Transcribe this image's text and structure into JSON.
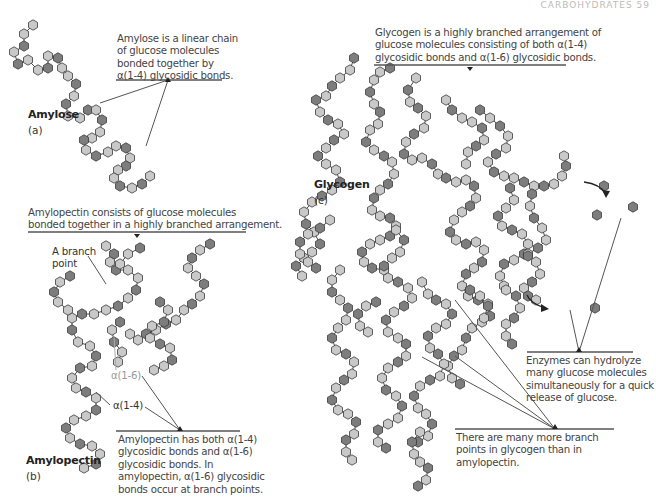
{
  "header": {
    "text": "CARBOHYDRATES  59"
  },
  "colors": {
    "light_unit": "#c9c9c9",
    "dark_unit": "#7d7d7d",
    "outline": "#3a3a3a",
    "text": "#444444",
    "rule": "#555555"
  },
  "amylose": {
    "label": "Amylose",
    "sublabel": "(a)",
    "caption_lines": [
      "Amylose is a linear chain",
      "of glucose molecules",
      "bonded together by",
      "α(1-4) glycosidic bonds."
    ]
  },
  "amylopectin": {
    "label": "Amylopectin",
    "sublabel": "(b)",
    "caption_top_lines": [
      "Amylopectin consists of glucose molecules",
      "bonded together in a highly branched arrangement."
    ],
    "branch_point_label": [
      "A branch",
      "point"
    ],
    "bond_16_label": "α(1-6)",
    "bond_14_label": "α(1-4)",
    "caption_bottom_lines": [
      "Amylopectin has both α(1-4)",
      "glycosidic bonds and α(1-6)",
      "glycosidic bonds. In",
      "amylopectin, α(1-6) glycosidic",
      "bonds occur at branch points."
    ]
  },
  "glycogen": {
    "label": "Glycogen",
    "sublabel": "(c)",
    "caption_top_lines": [
      "Glycogen is a highly branched arrangement of",
      "glucose molecules consisting of both α(1-4)",
      "glycosidic bonds and α(1-6) glycosidic bonds."
    ],
    "enzymes_caption_lines": [
      "Enzymes can hydrolyze",
      "many glucose molecules",
      "simultaneously for a quick",
      "release of glucose."
    ],
    "branch_caption_lines": [
      "There are many more branch",
      "points in glycogen than in",
      "amylopectin."
    ]
  },
  "chains": [
    [
      [
        33,
        25
      ],
      [
        24,
        34
      ],
      [
        24,
        46
      ],
      [
        14,
        52
      ],
      [
        18,
        64
      ],
      [
        28,
        60
      ],
      [
        38,
        70
      ],
      [
        48,
        68
      ],
      [
        48,
        56
      ],
      [
        58,
        58
      ],
      [
        62,
        68
      ],
      [
        68,
        76
      ],
      [
        76,
        84
      ],
      [
        74,
        96
      ],
      [
        66,
        104
      ],
      [
        68,
        116
      ],
      [
        80,
        118
      ],
      [
        88,
        110
      ],
      [
        96,
        110
      ],
      [
        102,
        120
      ],
      [
        100,
        132
      ],
      [
        92,
        138
      ],
      [
        84,
        140
      ],
      [
        86,
        150
      ],
      [
        96,
        156
      ],
      [
        108,
        152
      ],
      [
        116,
        146
      ],
      [
        126,
        148
      ],
      [
        130,
        158
      ],
      [
        126,
        166
      ],
      [
        118,
        170
      ],
      [
        114,
        178
      ],
      [
        120,
        186
      ],
      [
        132,
        188
      ],
      [
        142,
        184
      ],
      [
        150,
        176
      ]
    ],
    [
      [
        106,
        246
      ],
      [
        114,
        254
      ],
      [
        110,
        262
      ],
      [
        116,
        270
      ],
      [
        128,
        270
      ],
      [
        138,
        278
      ],
      [
        136,
        290
      ],
      [
        128,
        298
      ],
      [
        118,
        306
      ],
      [
        106,
        310
      ],
      [
        94,
        314
      ],
      [
        82,
        314
      ],
      [
        72,
        318
      ],
      [
        72,
        330
      ],
      [
        78,
        342
      ],
      [
        90,
        346
      ],
      [
        96,
        356
      ],
      [
        92,
        366
      ],
      [
        80,
        368
      ],
      [
        72,
        378
      ],
      [
        76,
        388
      ],
      [
        86,
        392
      ],
      [
        96,
        398
      ],
      [
        96,
        410
      ],
      [
        86,
        416
      ],
      [
        74,
        420
      ],
      [
        66,
        428
      ],
      [
        70,
        438
      ],
      [
        80,
        444
      ],
      [
        92,
        446
      ],
      [
        100,
        454
      ],
      [
        96,
        464
      ],
      [
        84,
        468
      ]
    ],
    [
      [
        140,
        248
      ],
      [
        128,
        254
      ],
      [
        120,
        264
      ]
    ],
    [
      [
        210,
        244
      ],
      [
        200,
        250
      ],
      [
        192,
        258
      ],
      [
        188,
        268
      ],
      [
        196,
        276
      ],
      [
        204,
        284
      ],
      [
        200,
        296
      ],
      [
        192,
        304
      ],
      [
        184,
        310
      ],
      [
        176,
        320
      ],
      [
        166,
        324
      ],
      [
        156,
        330
      ],
      [
        146,
        334
      ],
      [
        138,
        340
      ],
      [
        130,
        334
      ]
    ],
    [
      [
        160,
        302
      ],
      [
        168,
        310
      ],
      [
        164,
        322
      ],
      [
        152,
        326
      ],
      [
        150,
        338
      ],
      [
        160,
        344
      ],
      [
        170,
        348
      ],
      [
        172,
        360
      ],
      [
        164,
        366
      ],
      [
        154,
        370
      ]
    ],
    [
      [
        70,
        276
      ],
      [
        60,
        282
      ],
      [
        54,
        292
      ],
      [
        58,
        302
      ],
      [
        68,
        310
      ]
    ],
    [
      [
        120,
        322
      ],
      [
        112,
        330
      ],
      [
        114,
        342
      ],
      [
        122,
        352
      ],
      [
        118,
        362
      ]
    ],
    [
      [
        316,
        100
      ],
      [
        320,
        112
      ],
      [
        328,
        120
      ],
      [
        338,
        124
      ],
      [
        344,
        134
      ],
      [
        334,
        140
      ],
      [
        326,
        148
      ],
      [
        318,
        156
      ],
      [
        326,
        164
      ],
      [
        336,
        170
      ],
      [
        340,
        182
      ],
      [
        332,
        190
      ],
      [
        322,
        196
      ],
      [
        312,
        202
      ],
      [
        304,
        212
      ],
      [
        306,
        224
      ],
      [
        314,
        232
      ],
      [
        320,
        244
      ],
      [
        312,
        252
      ],
      [
        304,
        258
      ],
      [
        296,
        266
      ],
      [
        302,
        276
      ]
    ],
    [
      [
        354,
        58
      ],
      [
        350,
        70
      ],
      [
        340,
        78
      ],
      [
        332,
        86
      ],
      [
        326,
        96
      ]
    ],
    [
      [
        390,
        68
      ],
      [
        380,
        72
      ],
      [
        374,
        80
      ],
      [
        370,
        92
      ],
      [
        374,
        104
      ],
      [
        380,
        112
      ],
      [
        378,
        124
      ],
      [
        370,
        130
      ],
      [
        366,
        142
      ],
      [
        374,
        150
      ],
      [
        384,
        156
      ],
      [
        392,
        162
      ],
      [
        394,
        174
      ],
      [
        388,
        184
      ],
      [
        380,
        190
      ],
      [
        374,
        198
      ],
      [
        372,
        210
      ],
      [
        380,
        216
      ],
      [
        390,
        218
      ],
      [
        396,
        226
      ],
      [
        390,
        236
      ],
      [
        380,
        240
      ],
      [
        370,
        244
      ],
      [
        362,
        252
      ],
      [
        364,
        262
      ],
      [
        372,
        268
      ],
      [
        384,
        270
      ]
    ],
    [
      [
        416,
        78
      ],
      [
        408,
        90
      ],
      [
        410,
        102
      ],
      [
        418,
        108
      ],
      [
        426,
        116
      ],
      [
        424,
        128
      ],
      [
        414,
        134
      ],
      [
        406,
        142
      ],
      [
        404,
        154
      ],
      [
        412,
        160
      ],
      [
        422,
        158
      ],
      [
        432,
        164
      ],
      [
        438,
        174
      ],
      [
        446,
        178
      ],
      [
        456,
        182
      ],
      [
        466,
        180
      ],
      [
        474,
        186
      ],
      [
        476,
        198
      ],
      [
        470,
        206
      ],
      [
        462,
        212
      ],
      [
        454,
        220
      ],
      [
        450,
        232
      ],
      [
        456,
        240
      ],
      [
        466,
        244
      ],
      [
        476,
        242
      ],
      [
        484,
        250
      ],
      [
        482,
        262
      ],
      [
        474,
        268
      ],
      [
        466,
        274
      ],
      [
        462,
        286
      ],
      [
        468,
        296
      ],
      [
        478,
        300
      ],
      [
        488,
        304
      ],
      [
        490,
        316
      ],
      [
        482,
        322
      ],
      [
        472,
        328
      ],
      [
        466,
        338
      ],
      [
        462,
        350
      ],
      [
        454,
        356
      ],
      [
        448,
        366
      ],
      [
        452,
        378
      ],
      [
        460,
        384
      ]
    ],
    [
      [
        446,
        100
      ],
      [
        452,
        110
      ],
      [
        462,
        118
      ],
      [
        472,
        122
      ],
      [
        482,
        128
      ],
      [
        484,
        140
      ],
      [
        476,
        146
      ],
      [
        468,
        152
      ],
      [
        466,
        164
      ]
    ],
    [
      [
        480,
        110
      ],
      [
        490,
        118
      ],
      [
        500,
        126
      ],
      [
        508,
        136
      ],
      [
        506,
        148
      ],
      [
        496,
        154
      ],
      [
        488,
        162
      ],
      [
        494,
        172
      ],
      [
        504,
        176
      ],
      [
        514,
        178
      ],
      [
        524,
        182
      ],
      [
        534,
        186
      ],
      [
        544,
        186
      ],
      [
        554,
        184
      ],
      [
        562,
        176
      ],
      [
        566,
        166
      ],
      [
        564,
        156
      ]
    ],
    [
      [
        510,
        188
      ],
      [
        514,
        200
      ],
      [
        506,
        208
      ],
      [
        498,
        216
      ],
      [
        502,
        226
      ],
      [
        512,
        230
      ],
      [
        522,
        234
      ],
      [
        528,
        244
      ],
      [
        524,
        254
      ],
      [
        514,
        260
      ],
      [
        504,
        264
      ],
      [
        500,
        276
      ],
      [
        504,
        286
      ]
    ],
    [
      [
        532,
        194
      ],
      [
        530,
        206
      ],
      [
        534,
        218
      ],
      [
        542,
        228
      ],
      [
        546,
        240
      ],
      [
        538,
        248
      ],
      [
        528,
        254
      ]
    ],
    [
      [
        528,
        256
      ],
      [
        536,
        262
      ],
      [
        540,
        274
      ],
      [
        532,
        282
      ],
      [
        524,
        288
      ],
      [
        528,
        296
      ],
      [
        536,
        300
      ]
    ],
    [
      [
        330,
        220
      ],
      [
        320,
        228
      ],
      [
        308,
        234
      ],
      [
        300,
        242
      ],
      [
        300,
        254
      ],
      [
        308,
        262
      ],
      [
        316,
        268
      ]
    ],
    [
      [
        396,
        230
      ],
      [
        404,
        240
      ],
      [
        400,
        252
      ],
      [
        392,
        258
      ],
      [
        384,
        266
      ],
      [
        388,
        278
      ],
      [
        398,
        282
      ],
      [
        408,
        288
      ],
      [
        412,
        298
      ],
      [
        404,
        306
      ],
      [
        394,
        312
      ],
      [
        386,
        320
      ],
      [
        388,
        332
      ],
      [
        398,
        338
      ],
      [
        406,
        344
      ],
      [
        406,
        356
      ],
      [
        398,
        362
      ],
      [
        388,
        368
      ],
      [
        382,
        378
      ],
      [
        386,
        390
      ],
      [
        396,
        396
      ],
      [
        402,
        406
      ],
      [
        398,
        418
      ],
      [
        388,
        424
      ],
      [
        378,
        430
      ],
      [
        378,
        442
      ],
      [
        386,
        448
      ]
    ],
    [
      [
        422,
        282
      ],
      [
        428,
        294
      ],
      [
        436,
        300
      ],
      [
        446,
        304
      ],
      [
        452,
        314
      ],
      [
        446,
        324
      ],
      [
        436,
        328
      ],
      [
        428,
        336
      ],
      [
        430,
        348
      ],
      [
        438,
        354
      ],
      [
        444,
        364
      ],
      [
        440,
        376
      ],
      [
        430,
        380
      ],
      [
        420,
        386
      ],
      [
        414,
        396
      ],
      [
        418,
        408
      ],
      [
        426,
        414
      ],
      [
        432,
        424
      ],
      [
        428,
        436
      ],
      [
        418,
        442
      ]
    ],
    [
      [
        340,
        270
      ],
      [
        332,
        280
      ],
      [
        332,
        292
      ],
      [
        340,
        300
      ],
      [
        348,
        308
      ],
      [
        346,
        320
      ],
      [
        338,
        328
      ],
      [
        332,
        338
      ],
      [
        336,
        350
      ],
      [
        346,
        354
      ],
      [
        354,
        362
      ],
      [
        352,
        374
      ],
      [
        344,
        380
      ],
      [
        336,
        388
      ],
      [
        332,
        400
      ],
      [
        338,
        410
      ],
      [
        348,
        414
      ],
      [
        356,
        422
      ],
      [
        354,
        434
      ],
      [
        346,
        440
      ],
      [
        346,
        452
      ],
      [
        352,
        460
      ]
    ],
    [
      [
        376,
        302
      ],
      [
        366,
        306
      ],
      [
        358,
        314
      ],
      [
        360,
        326
      ],
      [
        368,
        332
      ]
    ],
    [
      [
        470,
        290
      ],
      [
        480,
        296
      ],
      [
        488,
        306
      ],
      [
        484,
        318
      ]
    ],
    [
      [
        506,
        290
      ],
      [
        516,
        296
      ],
      [
        520,
        308
      ],
      [
        514,
        318
      ],
      [
        506,
        324
      ],
      [
        506,
        336
      ],
      [
        512,
        344
      ]
    ],
    [
      [
        420,
        432
      ],
      [
        412,
        442
      ],
      [
        414,
        454
      ],
      [
        420,
        462
      ],
      [
        428,
        468
      ],
      [
        426,
        480
      ],
      [
        418,
        486
      ]
    ]
  ],
  "free_units": [
    [
      604,
      186
    ],
    [
      633,
      207
    ],
    [
      597,
      215
    ],
    [
      595,
      308
    ]
  ]
}
